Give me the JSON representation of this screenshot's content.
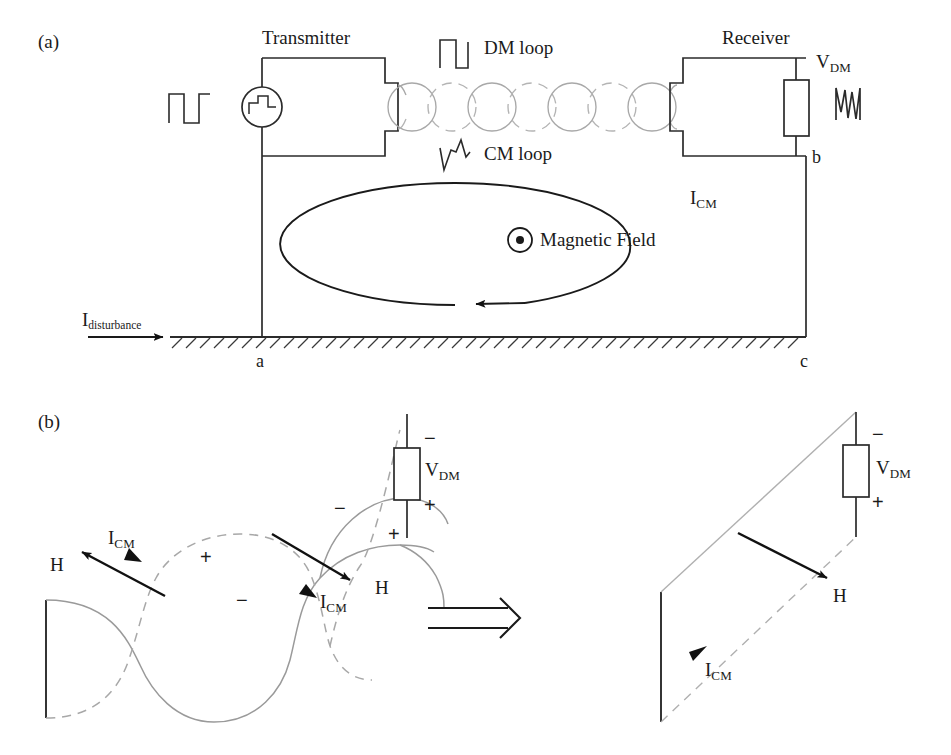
{
  "figure": {
    "panels": [
      {
        "tag": "(a)",
        "description": "Transmitter-receiver twisted pair link over ground plane with common mode current loop"
      },
      {
        "tag": "(b)",
        "description": "Twisted pair loop cancellation versus untwisted loop"
      }
    ]
  },
  "panel_a": {
    "tag": "(a)",
    "transmitter_label": "Transmitter",
    "receiver_label": "Receiver",
    "dm_loop_label": "DM loop",
    "cm_loop_label": "CM loop",
    "magnetic_field_label": "Magnetic Field",
    "vdm_label": "V",
    "vdm_sub": "DM",
    "icm_label": "I",
    "icm_sub": "CM",
    "idist_label": "I",
    "idist_sub": "disturbance",
    "node_a": "a",
    "node_b": "b",
    "node_c": "c",
    "waveform_source": "square-pulse",
    "waveform_transmitter_internal": "square-pulse",
    "waveform_dm": "square-pulse",
    "waveform_cm": "transient-spike",
    "waveform_receiver": "noisy-signal",
    "field_symbol": "dot-out-of-page"
  },
  "panel_b": {
    "tag": "(b)",
    "left": {
      "icm_label_1": "I",
      "icm_sub_1": "CM",
      "icm_label_2": "I",
      "icm_sub_2": "CM",
      "h_label_1": "H",
      "h_label_2": "H",
      "vdm_label": "V",
      "vdm_sub": "DM",
      "polarity_marks": [
        "+",
        "−",
        "−",
        "+",
        "−",
        "+"
      ]
    },
    "implies_symbol": "⇒",
    "right": {
      "icm_label": "I",
      "icm_sub": "CM",
      "h_label": "H",
      "vdm_label": "V",
      "vdm_sub": "DM",
      "polarity_top": "−",
      "polarity_bottom": "+"
    }
  },
  "colors": {
    "ink": "#1a1a1a",
    "wire": "#2b2b2b",
    "twist_light": "#a8a8a8",
    "twist_dashed": "#b4b4b4",
    "background": "#ffffff"
  }
}
